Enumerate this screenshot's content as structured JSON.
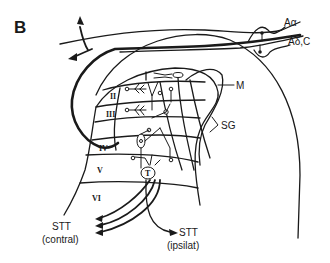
{
  "figure": {
    "panel_label": "B",
    "fiber_labels": {
      "a_alpha": "Aα",
      "a_delta_c": "Aδ,C"
    },
    "region_labels": {
      "marginal": "M",
      "substantia_gelatinosa": "SG"
    },
    "laminae": [
      "I",
      "II",
      "III",
      "IV",
      "V",
      "VI"
    ],
    "outputs": {
      "contralateral": {
        "line1": "STT",
        "line2": "(contral)"
      },
      "ipsilateral": {
        "line1": "STT",
        "line2": "(ipsilat)"
      }
    },
    "colors": {
      "ink": "#1a1a1a",
      "background": "#ffffff"
    }
  }
}
